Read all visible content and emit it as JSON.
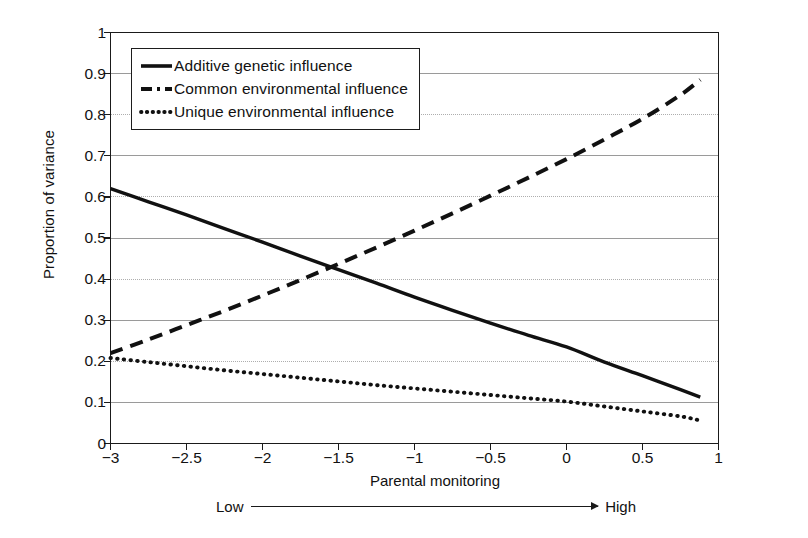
{
  "chart_data": {
    "type": "line",
    "title": "",
    "xlabel": "Parental monitoring",
    "ylabel": "Proportion of variance",
    "xlim": [
      -3,
      1
    ],
    "ylim": [
      0,
      1
    ],
    "grid": true,
    "legend_position": "upper left (inside axes)",
    "x_ticks": [
      "-3",
      "-2.5",
      "-2",
      "-1.5",
      "-1",
      "-0.5",
      "0",
      "0.5",
      "1"
    ],
    "x_tick_values": [
      -3,
      -2.5,
      -2,
      -1.5,
      -1,
      -0.5,
      0,
      0.5,
      1
    ],
    "y_ticks": [
      "0",
      "0.1",
      "0.2",
      "0.3",
      "0.4",
      "0.5",
      "0.6",
      "0.7",
      "0.8",
      "0.9",
      "1"
    ],
    "y_tick_values": [
      0,
      0.1,
      0.2,
      0.3,
      0.4,
      0.5,
      0.6,
      0.7,
      0.8,
      0.9,
      1
    ],
    "x": [
      -3,
      -2.75,
      -2.5,
      -2.25,
      -2,
      -1.75,
      -1.5,
      -1.25,
      -1,
      -0.75,
      -0.5,
      -0.25,
      0,
      0.25,
      0.5,
      0.75,
      0.88
    ],
    "series": [
      {
        "name": "Additive genetic influence",
        "style": "solid",
        "color": "#111111",
        "values": [
          0.62,
          0.588,
          0.556,
          0.523,
          0.49,
          0.456,
          0.423,
          0.39,
          0.356,
          0.324,
          0.293,
          0.263,
          0.235,
          0.198,
          0.165,
          0.131,
          0.113
        ]
      },
      {
        "name": "Common environmental influence",
        "style": "dashed",
        "color": "#111111",
        "values": [
          0.22,
          0.253,
          0.288,
          0.323,
          0.36,
          0.398,
          0.437,
          0.477,
          0.518,
          0.56,
          0.603,
          0.647,
          0.692,
          0.74,
          0.79,
          0.848,
          0.885
        ]
      },
      {
        "name": "Unique environmental influence",
        "style": "dotted",
        "color": "#111111",
        "values": [
          0.208,
          0.198,
          0.188,
          0.178,
          0.169,
          0.16,
          0.151,
          0.142,
          0.134,
          0.126,
          0.118,
          0.11,
          0.102,
          0.09,
          0.078,
          0.066,
          0.056
        ]
      }
    ],
    "annotations": [
      {
        "name": "range-low",
        "text": "Low"
      },
      {
        "name": "range-high",
        "text": "High"
      }
    ]
  },
  "axes": {
    "y_title": "Proportion of variance",
    "x_title": "Parental monitoring"
  },
  "legend": {
    "items": [
      {
        "label": "Additive genetic influence",
        "style": "solid"
      },
      {
        "label": "Common environmental influence",
        "style": "dashed"
      },
      {
        "label": "Unique environmental influence",
        "style": "dotted"
      }
    ]
  },
  "annotation": {
    "low": "Low",
    "high": "High"
  },
  "colors": {
    "line": "#111111",
    "grid": "#9a9a9a",
    "axis": "#1a1a1a",
    "background": "#ffffff"
  }
}
